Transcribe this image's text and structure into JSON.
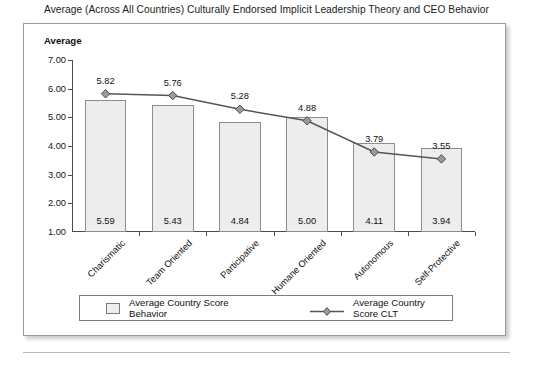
{
  "caption": "Average (Across All Countries) Culturally Endorsed Implicit Leadership Theory and CEO Behavior",
  "chart": {
    "y_axis_title": "Average"
  },
  "legend": {
    "series_behavior": "Average Country Score Behavior",
    "series_clt": "Average Country Score CLT"
  },
  "chart_data": {
    "type": "bar",
    "title": "Average (Across All Countries) Culturally Endorsed Implicit Leadership Theory and CEO Behavior",
    "xlabel": "",
    "ylabel": "Average",
    "ylim": [
      1.0,
      7.0
    ],
    "ytick_step": 1.0,
    "ytick_labels": [
      "7.00",
      "6.00",
      "5.00",
      "4.00",
      "3.00",
      "2.00",
      "1.00"
    ],
    "ytick_values": [
      7.0,
      6.0,
      5.0,
      4.0,
      3.0,
      2.0,
      1.0
    ],
    "grid": false,
    "legend_position": "bottom",
    "categories": [
      "Charismatic",
      "Team Oriented",
      "Participative",
      "Humane Oriented",
      "Autonomous",
      "Self-Protective"
    ],
    "series": [
      {
        "name": "Average Country Score Behavior",
        "type": "bar",
        "values": [
          5.59,
          5.43,
          4.84,
          5.0,
          4.11,
          3.94
        ],
        "labels": [
          "5.59",
          "5.43",
          "4.84",
          "5.00",
          "4.11",
          "3.94"
        ],
        "label_position": "inside-bottom",
        "fill": "#ededed",
        "edge": "#8d8d8d"
      },
      {
        "name": "Average Country Score CLT",
        "type": "line",
        "values": [
          5.82,
          5.76,
          5.28,
          4.88,
          3.79,
          3.55
        ],
        "labels": [
          "5.82",
          "5.76",
          "5.28",
          "4.88",
          "3.79",
          "3.55"
        ],
        "label_position": "above",
        "marker": "diamond",
        "color": "#555555",
        "marker_fill": "#9a9a9a"
      }
    ]
  }
}
